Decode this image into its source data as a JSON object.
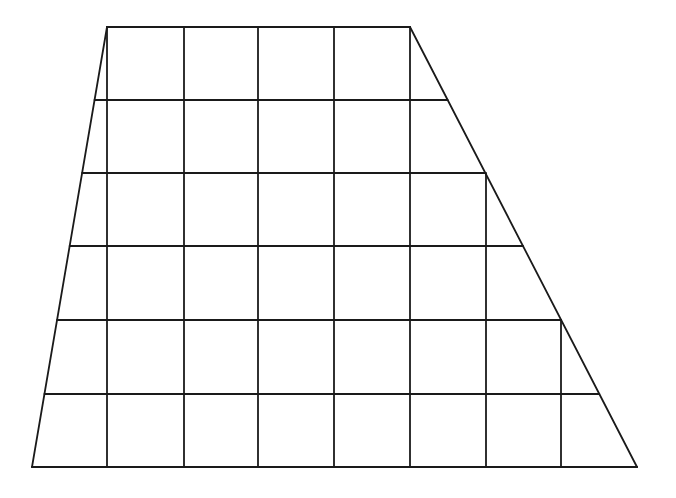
{
  "diagram": {
    "type": "trapezoid-on-grid",
    "stroke_color": "#1a1a1a",
    "background": "#ffffff",
    "trapezoid": {
      "top_left": [
        107,
        27
      ],
      "top_right": [
        410,
        27
      ],
      "bottom_right": [
        637,
        467
      ],
      "bottom_left": [
        32,
        467
      ]
    },
    "grid": {
      "rows": 6,
      "row_y": [
        27,
        100,
        173,
        246,
        320,
        394,
        467
      ],
      "column_x": [
        107,
        184,
        258,
        334,
        410,
        486,
        561
      ],
      "top_base_units": 4,
      "bottom_base_units": 8,
      "height_units": 6
    }
  }
}
